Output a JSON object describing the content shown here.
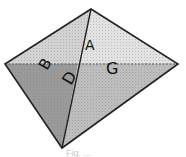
{
  "diagram": {
    "type": "pyramid-faces",
    "vertices": {
      "top": [
        91,
        9
      ],
      "left": [
        5,
        64
      ],
      "right": [
        178,
        64
      ],
      "bottom": [
        62,
        148
      ]
    },
    "faces": [
      {
        "id": "top-left",
        "color": "#d2d2d2"
      },
      {
        "id": "top-right",
        "color": "#e2e2e2"
      },
      {
        "id": "bottom-left",
        "color": "#9a9a9a"
      },
      {
        "id": "bottom-right",
        "color": "#bdbdbd"
      }
    ],
    "edge_color": "#222222",
    "hidden_edge_color": "#555555",
    "labels": [
      {
        "text": "A",
        "x": 88,
        "y": 50
      },
      {
        "text": "B",
        "x": 55,
        "y": 71
      },
      {
        "text": "G",
        "x": 118,
        "y": 74
      },
      {
        "text": "D",
        "x": 80,
        "y": 97
      }
    ],
    "caption": "Fig. ..."
  }
}
